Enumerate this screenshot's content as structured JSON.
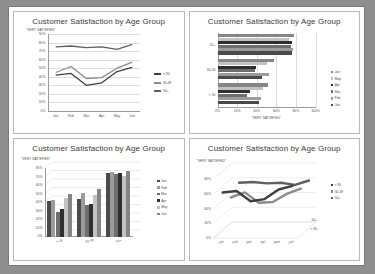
{
  "page": {
    "background_color": "#8e8e8e",
    "sheet_color": "#fdfdfd"
  },
  "common": {
    "title": "Customer Satisfaction by Age Group",
    "value_axis_title": "\"VERY SATISFIED\"",
    "months": [
      "Jan",
      "Feb",
      "Mar",
      "Apr",
      "May",
      "Jun"
    ],
    "age_groups": [
      "< 30",
      "30-49",
      "50+"
    ],
    "series_colors": {
      "lt30": "#3f3f3f",
      "a30_49": "#8c8c8c",
      "a50plus": "#5f5f5f",
      "jan": "#4a4a4a",
      "feb": "#9b9b9b",
      "mar": "#6e6e6e",
      "apr": "#2f2f2f",
      "may": "#c2c2c2",
      "jun": "#858585"
    }
  },
  "charts": [
    {
      "id": "line-2d",
      "type": "line",
      "title": "Customer Satisfaction by Age Group",
      "xlabel": "",
      "ylabel": "\"VERY SATISFIED\"",
      "x": [
        "Jan",
        "Feb",
        "Mar",
        "Apr",
        "May",
        "Jun"
      ],
      "ylim": [
        0,
        90
      ],
      "yticks": [
        "0%",
        "10%",
        "20%",
        "30%",
        "40%",
        "50%",
        "60%",
        "70%",
        "80%",
        "90%"
      ],
      "legend_position": "right",
      "grid": true,
      "series": [
        {
          "name": "< 30",
          "values": [
            42,
            44,
            30,
            33,
            46,
            51
          ]
        },
        {
          "name": "30-49",
          "values": [
            45,
            52,
            38,
            39,
            50,
            57
          ]
        },
        {
          "name": "50+",
          "values": [
            75,
            76,
            74,
            75,
            72,
            78
          ]
        }
      ]
    },
    {
      "id": "bar-horizontal",
      "type": "bar",
      "orientation": "horizontal",
      "title": "Customer Satisfaction by Age Group",
      "xlabel": "\"VERY SATISFIED\"",
      "ylabel": "",
      "categories": [
        "< 30",
        "30-49",
        "50+"
      ],
      "xlim": [
        0,
        100
      ],
      "xticks": [
        "0%",
        "20%",
        "40%",
        "60%",
        "80%",
        "100%"
      ],
      "legend_position": "right",
      "legend_order": [
        "Jun",
        "May",
        "Apr",
        "Mar",
        "Feb",
        "Jan"
      ],
      "grid": true,
      "series": [
        {
          "name": "Jan",
          "values": [
            42,
            45,
            75
          ]
        },
        {
          "name": "Feb",
          "values": [
            44,
            52,
            76
          ]
        },
        {
          "name": "Mar",
          "values": [
            30,
            38,
            74
          ]
        },
        {
          "name": "Apr",
          "values": [
            33,
            39,
            75
          ]
        },
        {
          "name": "May",
          "values": [
            46,
            50,
            72
          ]
        },
        {
          "name": "Jun",
          "values": [
            51,
            57,
            78
          ]
        }
      ]
    },
    {
      "id": "column-3d",
      "type": "bar",
      "orientation": "vertical",
      "title": "Customer Satisfaction by Age Group",
      "xlabel": "",
      "ylabel": "\"VERY SATISFIED\"",
      "categories": [
        "< 30",
        "30-49",
        "50+"
      ],
      "ylim": [
        0,
        80
      ],
      "yticks": [
        "0%",
        "10%",
        "20%",
        "30%",
        "40%",
        "50%",
        "60%",
        "70%",
        "80%"
      ],
      "legend_position": "right",
      "legend_order": [
        "Jan",
        "Feb",
        "Mar",
        "Apr",
        "May",
        "Jun"
      ],
      "grid": true,
      "series": [
        {
          "name": "Jan",
          "values": [
            42,
            45,
            75
          ]
        },
        {
          "name": "Feb",
          "values": [
            44,
            52,
            76
          ]
        },
        {
          "name": "Mar",
          "values": [
            30,
            38,
            74
          ]
        },
        {
          "name": "Apr",
          "values": [
            33,
            39,
            75
          ]
        },
        {
          "name": "May",
          "values": [
            46,
            50,
            72
          ]
        },
        {
          "name": "Jun",
          "values": [
            51,
            57,
            78
          ]
        }
      ]
    },
    {
      "id": "line-3d",
      "type": "line",
      "title": "Customer Satisfaction by Age Group",
      "xlabel": "",
      "ylabel": "\"VERY SATISFIED\"",
      "x": [
        "Jan",
        "Feb",
        "Mar",
        "Apr",
        "May",
        "Jun"
      ],
      "ylim": [
        0,
        80
      ],
      "yticks": [
        "0%",
        "20%",
        "40%",
        "60%",
        "80%"
      ],
      "depth_labels": [
        "50+",
        "< 30"
      ],
      "legend_position": "right",
      "legend_order": [
        "< 30",
        "30-49",
        "50+"
      ],
      "grid": true,
      "series": [
        {
          "name": "< 30",
          "values": [
            42,
            44,
            30,
            33,
            46,
            51
          ]
        },
        {
          "name": "30-49",
          "values": [
            45,
            52,
            38,
            39,
            50,
            57
          ]
        },
        {
          "name": "50+",
          "values": [
            75,
            76,
            74,
            75,
            72,
            78
          ]
        }
      ]
    }
  ]
}
